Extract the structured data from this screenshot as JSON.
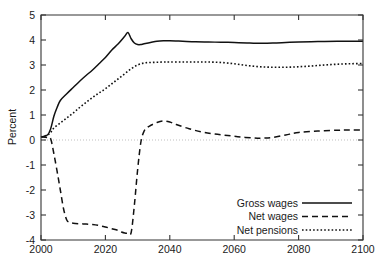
{
  "chart_data": {
    "type": "line",
    "title": "",
    "xlabel": "",
    "ylabel": "Percent",
    "xlim": [
      2000,
      2100
    ],
    "ylim": [
      -4,
      5
    ],
    "xticks": [
      2000,
      2020,
      2040,
      2060,
      2080,
      2100
    ],
    "yticks": [
      -4,
      -3,
      -2,
      -1,
      0,
      1,
      2,
      3,
      4,
      5
    ],
    "xtick_labels": [
      "2000",
      "2020",
      "2040",
      "2060",
      "2080",
      "2100"
    ],
    "ytick_labels": [
      "-4",
      "-3",
      "-2",
      "-1",
      "0",
      "1",
      "2",
      "3",
      "4",
      "5"
    ],
    "grid": false,
    "zero_reference_line": true,
    "legend_position": "bottom-right",
    "line_color": "#111111",
    "zero_line_color": "#b8b8b8",
    "axis_color": "#333333",
    "series": [
      {
        "name": "Gross wages",
        "style": "solid",
        "x": [
          2000,
          2002,
          2003,
          2004,
          2005,
          2006,
          2008,
          2010,
          2012,
          2014,
          2016,
          2018,
          2020,
          2022,
          2024,
          2026,
          2027,
          2028,
          2029,
          2030,
          2031,
          2032,
          2034,
          2036,
          2038,
          2040,
          2044,
          2048,
          2052,
          2056,
          2060,
          2064,
          2066,
          2068,
          2072,
          2076,
          2080,
          2086,
          2092,
          2096,
          2100
        ],
        "values": [
          0.12,
          0.2,
          0.45,
          0.95,
          1.3,
          1.58,
          1.85,
          2.1,
          2.35,
          2.58,
          2.8,
          3.05,
          3.3,
          3.6,
          3.85,
          4.15,
          4.3,
          4.05,
          3.88,
          3.82,
          3.82,
          3.85,
          3.9,
          3.95,
          3.97,
          3.97,
          3.95,
          3.93,
          3.92,
          3.91,
          3.9,
          3.88,
          3.87,
          3.87,
          3.88,
          3.9,
          3.92,
          3.94,
          3.95,
          3.95,
          3.95
        ]
      },
      {
        "name": "Net wages",
        "style": "dashed",
        "x": [
          2000,
          2002,
          2003,
          2004,
          2005,
          2006,
          2007,
          2008,
          2009,
          2010,
          2012,
          2014,
          2016,
          2018,
          2020,
          2022,
          2024,
          2025,
          2026,
          2027,
          2028,
          2029,
          2030,
          2031,
          2032,
          2033,
          2034,
          2036,
          2038,
          2040,
          2042,
          2046,
          2050,
          2054,
          2058,
          2062,
          2066,
          2068,
          2070,
          2072,
          2076,
          2080,
          2086,
          2092,
          2096,
          2100
        ],
        "values": [
          0.12,
          0.1,
          0.05,
          -0.55,
          -1.25,
          -2.0,
          -2.75,
          -3.2,
          -3.3,
          -3.33,
          -3.35,
          -3.36,
          -3.38,
          -3.42,
          -3.48,
          -3.55,
          -3.62,
          -3.68,
          -3.72,
          -3.73,
          -3.7,
          -2.6,
          -1.2,
          -0.1,
          0.35,
          0.5,
          0.58,
          0.7,
          0.76,
          0.72,
          0.62,
          0.45,
          0.32,
          0.24,
          0.18,
          0.12,
          0.08,
          0.07,
          0.08,
          0.1,
          0.2,
          0.3,
          0.36,
          0.39,
          0.4,
          0.4
        ]
      },
      {
        "name": "Net pensions",
        "style": "dotted",
        "x": [
          2000,
          2002,
          2003,
          2004,
          2006,
          2008,
          2010,
          2012,
          2014,
          2016,
          2018,
          2020,
          2022,
          2024,
          2026,
          2028,
          2030,
          2032,
          2034,
          2036,
          2038,
          2040,
          2044,
          2048,
          2052,
          2056,
          2060,
          2064,
          2068,
          2072,
          2076,
          2080,
          2084,
          2088,
          2092,
          2096,
          2100
        ],
        "values": [
          0.12,
          0.2,
          0.3,
          0.48,
          0.68,
          0.88,
          1.08,
          1.3,
          1.5,
          1.7,
          1.88,
          2.05,
          2.25,
          2.45,
          2.65,
          2.85,
          3.0,
          3.08,
          3.1,
          3.11,
          3.12,
          3.12,
          3.12,
          3.12,
          3.12,
          3.1,
          3.05,
          2.98,
          2.93,
          2.91,
          2.91,
          2.93,
          2.96,
          3.0,
          3.03,
          3.05,
          3.06
        ]
      }
    ]
  },
  "legend": {
    "items": [
      {
        "label": "Gross wages",
        "style": "solid"
      },
      {
        "label": "Net wages",
        "style": "dashed"
      },
      {
        "label": "Net pensions",
        "style": "dotted"
      }
    ]
  }
}
